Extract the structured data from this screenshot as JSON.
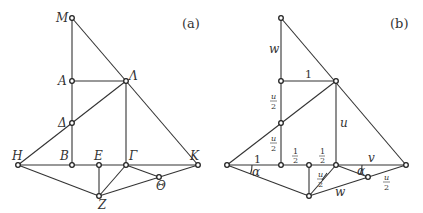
{
  "panels": [
    {
      "id": "a",
      "panel_label": "(a)",
      "points": {
        "M": "M",
        "A": "A",
        "Lambda": "Λ",
        "Delta": "Δ",
        "B": "B",
        "E": "E",
        "Gamma": "Γ",
        "K": "K",
        "H": "H",
        "Z": "Z",
        "Theta": "Θ"
      }
    },
    {
      "id": "b",
      "panel_label": "(b)",
      "labels": {
        "w_top": "w",
        "one_top": "1",
        "u_over_2_upper_num": "u",
        "u_over_2_upper_den": "2",
        "u_over_2_lower_num": "u",
        "u_over_2_lower_den": "2",
        "u_right": "u",
        "half_left_num": "1",
        "half_left_den": "2",
        "half_right_num": "1",
        "half_right_den": "2",
        "one_left": "1",
        "alpha_left": "α",
        "u_over_2_mid_num": "u",
        "u_over_2_mid_den": "2",
        "alpha_right": "α",
        "v": "v",
        "u_over_2_right_num": "u",
        "u_over_2_right_den": "2",
        "w_bottom": "w"
      }
    }
  ]
}
